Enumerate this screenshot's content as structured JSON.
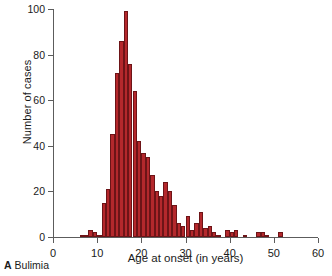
{
  "caption": {
    "panel_letter": "A",
    "panel_title": "Bulimia"
  },
  "chart_data": {
    "type": "bar",
    "title": "",
    "subtitle": "",
    "xlabel": "Age at onset (in years)",
    "ylabel": "Number of cases",
    "xlim": [
      0,
      60
    ],
    "ylim": [
      0,
      100
    ],
    "xticks": [
      0,
      10,
      20,
      30,
      40,
      50,
      60
    ],
    "yticks": [
      0,
      20,
      40,
      60,
      80,
      100
    ],
    "xtick_labels": [
      "0",
      "10",
      "20",
      "30",
      "40",
      "50",
      "60"
    ],
    "ytick_labels": [
      "0",
      "20",
      "40",
      "60",
      "80",
      "100"
    ],
    "grid": false,
    "legend": null,
    "bin_width": 1,
    "bar_color": "#b4282c",
    "bar_edge_color": "#6d1417",
    "axis_color": "#5c5c5c",
    "categories": [
      6,
      7,
      8,
      9,
      10,
      11,
      12,
      13,
      14,
      15,
      16,
      17,
      18,
      19,
      20,
      21,
      22,
      23,
      24,
      25,
      26,
      27,
      28,
      29,
      30,
      31,
      32,
      33,
      34,
      35,
      36,
      37,
      38,
      39,
      40,
      41,
      42,
      43,
      44,
      45,
      46,
      47,
      48,
      49,
      50,
      51
    ],
    "values": [
      1,
      1,
      3,
      2,
      1,
      15,
      21,
      45,
      72,
      86,
      99,
      76,
      64,
      42,
      37,
      35,
      27,
      20,
      18,
      24,
      20,
      14,
      6,
      5,
      9,
      3,
      6,
      11,
      4,
      5,
      2,
      1,
      0,
      3,
      2,
      3,
      0,
      1,
      0,
      0,
      2,
      2,
      1,
      0,
      0,
      2
    ],
    "series": [
      {
        "name": "Number of cases",
        "values": [
          1,
          1,
          3,
          2,
          1,
          15,
          21,
          45,
          72,
          86,
          99,
          76,
          64,
          42,
          37,
          35,
          27,
          20,
          18,
          24,
          20,
          14,
          6,
          5,
          9,
          3,
          6,
          11,
          4,
          5,
          2,
          1,
          0,
          3,
          2,
          3,
          0,
          1,
          0,
          0,
          2,
          2,
          1,
          0,
          0,
          2
        ]
      }
    ]
  }
}
